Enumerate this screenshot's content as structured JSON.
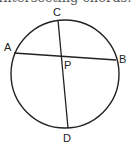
{
  "caption": "Intersecting chords: AP · PB = CP · PD",
  "diagram": {
    "circle": {
      "cx": 65,
      "cy": 74,
      "r": 54
    },
    "points": {
      "A": {
        "label": "A",
        "x": 14,
        "y": 53
      },
      "B": {
        "label": "B",
        "x": 116,
        "y": 60
      },
      "C": {
        "label": "C",
        "x": 58,
        "y": 20
      },
      "D": {
        "label": "D",
        "x": 68,
        "y": 128
      },
      "P": {
        "label": "P",
        "x": 61,
        "y": 56
      }
    },
    "chords": [
      {
        "from": "A",
        "to": "B"
      },
      {
        "from": "C",
        "to": "D"
      }
    ],
    "stroke_color": "#222222"
  }
}
